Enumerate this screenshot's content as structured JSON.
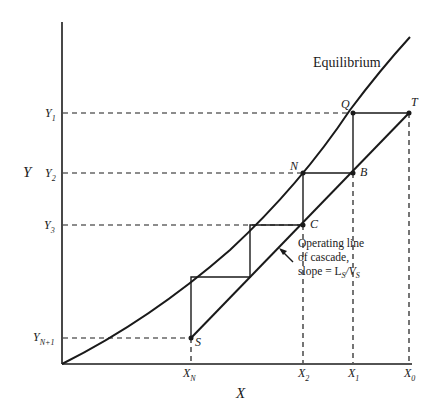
{
  "diagram": {
    "type": "McCabe-Thiele stage construction (countercurrent cascade)",
    "axes": {
      "x_label": "X",
      "y_label": "Y"
    },
    "curves": {
      "equilibrium_label": "Equilibrium",
      "operating_line_label_1": "Operating line",
      "operating_line_label_2": "of cascade,",
      "operating_line_label_3": "slope = L",
      "operating_slope_sub1": "S",
      "operating_slope_mid": "/V",
      "operating_slope_sub2": "S"
    },
    "y_ticks": [
      {
        "main": "Y",
        "sub": "1"
      },
      {
        "main": "Y",
        "sub": "2"
      },
      {
        "main": "Y",
        "sub": "3"
      },
      {
        "main": "Y",
        "sub": "N+1"
      }
    ],
    "x_ticks": [
      {
        "main": "X",
        "sub": "N"
      },
      {
        "main": "X",
        "sub": "2"
      },
      {
        "main": "X",
        "sub": "1"
      },
      {
        "main": "X",
        "sub": "0"
      }
    ],
    "points": {
      "Q": "Q",
      "T": "T",
      "N": "N",
      "B": "B",
      "C": "C",
      "S": "S"
    },
    "colors": {
      "line": "#1a1a1a",
      "background": "#ffffff"
    }
  }
}
